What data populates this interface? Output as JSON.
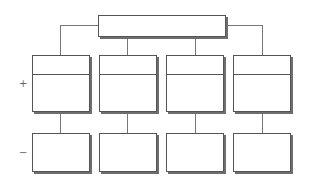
{
  "diagram": {
    "type": "hierarchy",
    "root": {
      "label": "",
      "x": 98,
      "y": 15,
      "w": 128,
      "h": 22
    },
    "row_labels": [
      {
        "text": "+",
        "x": 19,
        "y": 79
      },
      {
        "text": "−",
        "x": 19,
        "y": 148
      }
    ],
    "upper_boxes": [
      {
        "label_top": "",
        "label_bottom": "",
        "x": 32,
        "y": 55,
        "w": 58,
        "h": 57,
        "divider_y": 18
      },
      {
        "label_top": "",
        "label_bottom": "",
        "x": 99,
        "y": 55,
        "w": 58,
        "h": 57,
        "divider_y": 18
      },
      {
        "label_top": "",
        "label_bottom": "",
        "x": 166,
        "y": 55,
        "w": 58,
        "h": 57,
        "divider_y": 18
      },
      {
        "label_top": "",
        "label_bottom": "",
        "x": 233,
        "y": 55,
        "w": 58,
        "h": 57,
        "divider_y": 18
      }
    ],
    "lower_boxes": [
      {
        "label": "",
        "x": 32,
        "y": 133,
        "w": 58,
        "h": 39
      },
      {
        "label": "",
        "x": 99,
        "y": 133,
        "w": 58,
        "h": 39
      },
      {
        "label": "",
        "x": 166,
        "y": 133,
        "w": 58,
        "h": 39
      },
      {
        "label": "",
        "x": 233,
        "y": 133,
        "w": 58,
        "h": 39
      }
    ],
    "colors": {
      "border": "#555555",
      "shadow": "#6e6e6e",
      "connector": "#777777",
      "background": "#ffffff"
    }
  }
}
